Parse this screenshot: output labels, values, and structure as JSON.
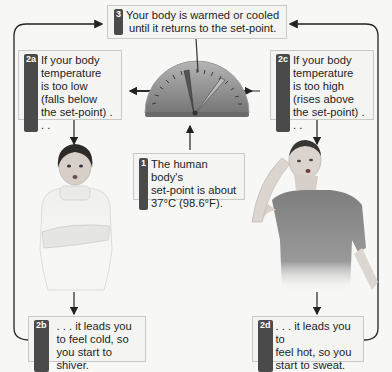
{
  "colors": {
    "background": "#f7f7f6",
    "box_fill": "#f4f4f2",
    "box_border": "#c9c9c6",
    "badge": "#4a4a4a",
    "arrow": "#222222",
    "dial": "#8e8e8e",
    "shirt_cold": "#ececec",
    "shirt_hot": "#7a7a7a"
  },
  "steps": {
    "s3": {
      "badge": "3",
      "text": "Your body is warmed or cooled\nuntil it returns to the set-point."
    },
    "s2a": {
      "badge": "2a",
      "text": "If your body\ntemperature\nis too low\n(falls below\nthe set-point) . . ."
    },
    "s2c": {
      "badge": "2c",
      "text": "If your body\ntemperature\nis too high\n(rises above\nthe set-point) . . ."
    },
    "s1": {
      "badge": "1",
      "text": "The human body's\nset-point is about\n37°C (98.6°F)."
    },
    "s2b": {
      "badge": "2b",
      "text": ". . . it leads you\nto feel cold, so\nyou start to shiver."
    },
    "s2d": {
      "badge": "2d",
      "text": ". . . it leads you to\nfeel hot, so you\nstart to sweat."
    }
  },
  "icons": {
    "dial": "thermostat-dial-icon",
    "cold_person": "shivering-person-illustration",
    "hot_person": "sweating-person-illustration"
  }
}
